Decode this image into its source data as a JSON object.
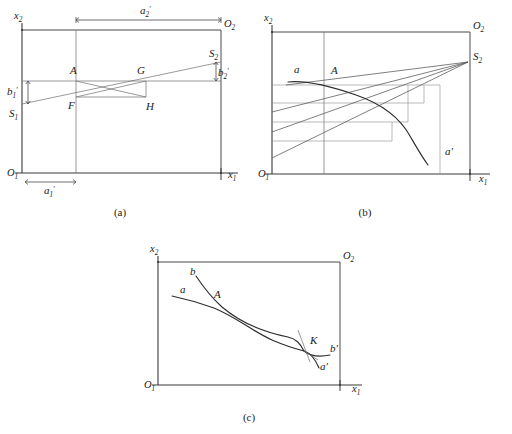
{
  "figure": {
    "background": "#ffffff",
    "line_color": "#3a3a3a",
    "curve_color": "#2d2d2d"
  },
  "panels": [
    {
      "id": "a",
      "caption": "(a)",
      "axes": {
        "y_label": "x",
        "y_label_sub": "2",
        "x_label": "x",
        "x_label_sub": "1",
        "origin_label": "O",
        "origin_sub": "1"
      },
      "corner_label": "O",
      "corner_sub": "2",
      "points": [
        {
          "name": "A",
          "label": "A"
        },
        {
          "name": "G",
          "label": "G"
        },
        {
          "name": "F",
          "label": "F"
        },
        {
          "name": "H",
          "label": "H"
        },
        {
          "name": "S1",
          "label": "S",
          "sub": "1"
        },
        {
          "name": "S2",
          "label": "S",
          "sub": "2"
        }
      ],
      "dimensions": [
        {
          "name": "a2-prime",
          "label": "a",
          "sub": "2",
          "prime": "'"
        },
        {
          "name": "a1-prime",
          "label": "a",
          "sub": "1",
          "prime": "'"
        },
        {
          "name": "b1-prime",
          "label": "b",
          "sub": "1",
          "prime": "'"
        },
        {
          "name": "b2-prime",
          "label": "b",
          "sub": "2",
          "prime": "'"
        }
      ]
    },
    {
      "id": "b",
      "caption": "(b)",
      "axes": {
        "y_label": "x",
        "y_label_sub": "2",
        "x_label": "x",
        "x_label_sub": "1",
        "origin_label": "O",
        "origin_sub": "1"
      },
      "corner_label": "O",
      "corner_sub": "2",
      "points": [
        {
          "name": "A",
          "label": "A"
        },
        {
          "name": "S2",
          "label": "S",
          "sub": "2"
        }
      ],
      "curve_labels": [
        {
          "name": "curve-a-start",
          "label": "a"
        },
        {
          "name": "curve-a-end",
          "label": "a'"
        }
      ]
    },
    {
      "id": "c",
      "caption": "(c)",
      "axes": {
        "y_label": "x",
        "y_label_sub": "2",
        "x_label": "x",
        "x_label_sub": "1",
        "origin_label": "O",
        "origin_sub": "1"
      },
      "corner_label": "O",
      "corner_sub": "2",
      "points": [
        {
          "name": "A",
          "label": "A"
        },
        {
          "name": "K",
          "label": "K"
        }
      ],
      "curve_labels": [
        {
          "name": "curve-a-start",
          "label": "a"
        },
        {
          "name": "curve-a-end",
          "label": "a'"
        },
        {
          "name": "curve-b-start",
          "label": "b"
        },
        {
          "name": "curve-b-end",
          "label": "b'"
        }
      ]
    }
  ]
}
